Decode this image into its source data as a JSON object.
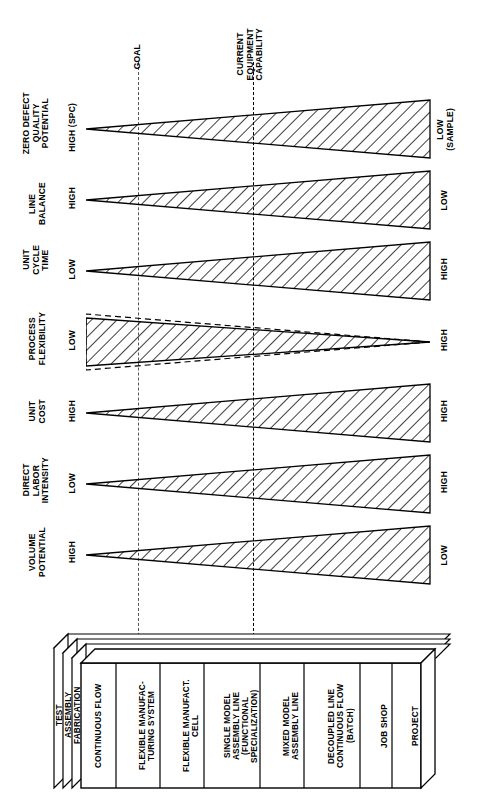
{
  "diagram": {
    "reference_lines": [
      {
        "id": "goal",
        "label": "GOAL",
        "x_px": 138
      },
      {
        "id": "current-equipment-capability",
        "label": "CURRENT\nEQUIPMENT\nCAPABILITY",
        "x_px": 253
      }
    ],
    "criteria": [
      {
        "id": "zero-defect-quality-potential",
        "title": "ZERO DEFECT\nQUALITY\nPOTENTIAL",
        "left_value": "HIGH (SPC)",
        "right_value": "LOW\n(SAMPLE)",
        "direction": "widens-right",
        "style": "hatched",
        "y_center": 129
      },
      {
        "id": "line-balance",
        "title": "LINE\nBALANCE",
        "left_value": "HIGH",
        "right_value": "LOW",
        "direction": "widens-right",
        "style": "hatched",
        "y_center": 200
      },
      {
        "id": "unit-cycle-time",
        "title": "UNIT\nCYCLE\nTIME",
        "left_value": "LOW",
        "right_value": "HIGH",
        "direction": "widens-right",
        "style": "hatched",
        "y_center": 271
      },
      {
        "id": "process-flexibility",
        "title": "PROCESS\nFLEXIBILITY",
        "left_value": "LOW",
        "right_value": "HIGH",
        "direction": "widens-left",
        "style": "hatched-with-dashed-overlay",
        "y_center": 342
      },
      {
        "id": "unit-cost",
        "title": "UNIT\nCOST",
        "left_value": "HIGH",
        "right_value": "HIGH",
        "direction": "widens-right",
        "style": "hatched",
        "y_center": 413
      },
      {
        "id": "direct-labor-intensity",
        "title": "DIRECT\nLABOR\nINTENSITY",
        "left_value": "LOW",
        "right_value": "HIGH",
        "direction": "widens-right",
        "style": "hatched",
        "y_center": 484
      },
      {
        "id": "volume-potential",
        "title": "VOLUME\nPOTENTIAL",
        "left_value": "HIGH",
        "right_value": "LOW",
        "direction": "widens-right",
        "style": "hatched",
        "y_center": 555
      }
    ],
    "process_box": {
      "stack_layers": [
        "TEST",
        "ASSEMBLY",
        "FABRICATION"
      ],
      "processes": [
        {
          "id": "continuous-flow",
          "label": "CONTINUOUS FLOW"
        },
        {
          "id": "flexible-manufacturing-system",
          "label": "FLEXIBLE MANUFAC-\nTURING SYSTEM"
        },
        {
          "id": "flexible-manufacturing-cell",
          "label": "FLEXIBLE MANUFACT.\nCELL"
        },
        {
          "id": "single-model-assembly-line",
          "label": "SINGLE MODEL\nASSEMBLY LINE\n(FUNCTIONAL\nSPECIALIZATION)"
        },
        {
          "id": "mixed-model-assembly-line",
          "label": "MIXED MODEL\nASSEMBLY LINE"
        },
        {
          "id": "decoupled-line-continuous-flow-batch",
          "label": "DECOUPLED LINE\nCONTINUOUS FLOW\n(BATCH)"
        },
        {
          "id": "job-shop",
          "label": "JOB SHOP"
        },
        {
          "id": "project",
          "label": "PROJECT"
        }
      ]
    },
    "colors": {
      "stroke": "#000000",
      "background": "#ffffff",
      "hatch": "#000000"
    }
  }
}
